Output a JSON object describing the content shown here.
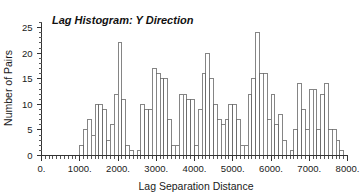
{
  "chart_data": {
    "type": "bar",
    "title": "Lag Histogram: Y Direction",
    "xlabel": "Lag Separation Distance",
    "ylabel": "Number of Pairs",
    "xlim": [
      0,
      8000
    ],
    "ylim": [
      0,
      26
    ],
    "grid": false,
    "legend": null,
    "bin_width": 100,
    "x_tick_labels": [
      "0.",
      "1000.",
      "2000.",
      "3000.",
      "4000.",
      "5000.",
      "6000.",
      "7000.",
      "8000."
    ],
    "x_tick_values": [
      0,
      1000,
      2000,
      3000,
      4000,
      5000,
      6000,
      7000,
      8000
    ],
    "x_minor_tick_step": 100,
    "y_tick_labels": [
      "0",
      "5",
      "10",
      "15",
      "20",
      "25"
    ],
    "y_tick_values": [
      0,
      5,
      10,
      15,
      20,
      25
    ],
    "y_minor_tick_step": 1,
    "bin_starts": [
      1000,
      1100,
      1200,
      1300,
      1400,
      1500,
      1600,
      1700,
      1800,
      1900,
      2000,
      2100,
      2200,
      2300,
      2400,
      2500,
      2600,
      2700,
      2800,
      2900,
      3000,
      3100,
      3200,
      3300,
      3400,
      3500,
      3600,
      3700,
      3800,
      3900,
      4000,
      4100,
      4200,
      4300,
      4400,
      4500,
      4600,
      4700,
      4800,
      4900,
      5000,
      5100,
      5200,
      5300,
      5400,
      5500,
      5600,
      5700,
      5800,
      5900,
      6000,
      6100,
      6200,
      6300,
      6400,
      6500,
      6600,
      6700,
      6800,
      6900,
      7000,
      7100,
      7200,
      7300,
      7400,
      7500,
      7600,
      7700,
      7800,
      7900
    ],
    "values": [
      2,
      5,
      7,
      4,
      10,
      10,
      9,
      3,
      6,
      12,
      22,
      11,
      2,
      1,
      0,
      1,
      10,
      9,
      9,
      17,
      16,
      15,
      15,
      7,
      2,
      2,
      12,
      12,
      11,
      11,
      2,
      9,
      16,
      20,
      15,
      10,
      7,
      6,
      7,
      10,
      10,
      7,
      2,
      2,
      12,
      15,
      24,
      16,
      16,
      7,
      12,
      6,
      8,
      3,
      0,
      1,
      5,
      14,
      9,
      5,
      13,
      13,
      5,
      12,
      14,
      5,
      5,
      3,
      1,
      0
    ],
    "categories": [
      "1000",
      "1100",
      "1200",
      "1300",
      "1400",
      "1500",
      "1600",
      "1700",
      "1800",
      "1900",
      "2000",
      "2100",
      "2200",
      "2300",
      "2400",
      "2500",
      "2600",
      "2700",
      "2800",
      "2900",
      "3000",
      "3100",
      "3200",
      "3300",
      "3400",
      "3500",
      "3600",
      "3700",
      "3800",
      "3900",
      "4000",
      "4100",
      "4200",
      "4300",
      "4400",
      "4500",
      "4600",
      "4700",
      "4800",
      "4900",
      "5000",
      "5100",
      "5200",
      "5300",
      "5400",
      "5500",
      "5600",
      "5700",
      "5800",
      "5900",
      "6000",
      "6100",
      "6200",
      "6300",
      "6400",
      "6500",
      "6600",
      "6700",
      "6800",
      "6900",
      "7000",
      "7100",
      "7200",
      "7300",
      "7400",
      "7500",
      "7600",
      "7700",
      "7800",
      "7900"
    ]
  },
  "style": {
    "bar_fill": "#ffffff",
    "bar_stroke": "#666666",
    "axis_color": "#333333",
    "text_color": "#1a1a1a",
    "background": "#ffffff"
  }
}
